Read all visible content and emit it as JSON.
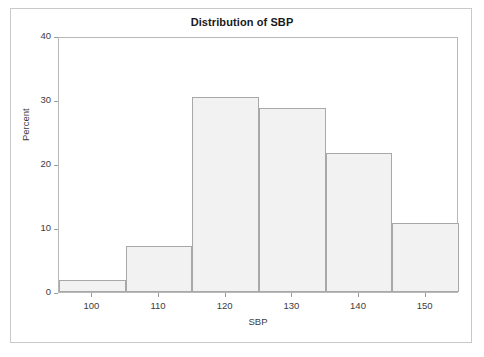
{
  "figure": {
    "background_color": "#ffffff",
    "frame_color": "#c9c9c9"
  },
  "chart_data": {
    "type": "bar",
    "title": "Distribution of SBP",
    "xlabel": "SBP",
    "ylabel": "Percent",
    "grid": false,
    "legend": null,
    "xlim": [
      95,
      155
    ],
    "ylim": [
      0,
      40
    ],
    "xticks": [
      100,
      110,
      120,
      130,
      140,
      150
    ],
    "yticks": [
      0,
      10,
      20,
      30,
      40
    ],
    "bin_edges": [
      95,
      105,
      115,
      125,
      135,
      145,
      155
    ],
    "bin_width": 10,
    "categories": [
      "95-105",
      "105-115",
      "115-125",
      "125-135",
      "135-145",
      "145-155"
    ],
    "bin_centers": [
      100,
      110,
      120,
      130,
      140,
      150
    ],
    "values": [
      1.8,
      7.2,
      30.4,
      28.8,
      21.7,
      10.8
    ],
    "bar_fill_color": "#f2f2f2",
    "bar_edge_color": "#a8a8a8"
  },
  "axes": {
    "x_tick_labels": [
      "100",
      "110",
      "120",
      "130",
      "140",
      "150"
    ],
    "y_tick_labels": [
      "0",
      "10",
      "20",
      "30",
      "40"
    ]
  }
}
